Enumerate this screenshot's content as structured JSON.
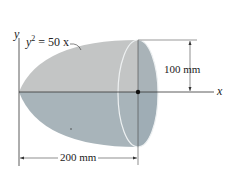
{
  "figure": {
    "equation": {
      "lhs": "y",
      "exponent": "2",
      "rhs": " = 50 x"
    },
    "axes": {
      "x_label": "x",
      "y_label": "y"
    },
    "dimensions": {
      "radius_label": "100 mm",
      "length_label": "200 mm"
    },
    "colors": {
      "upper_surface": "#c3c5c5",
      "lower_surface": "#a8b4ba",
      "end_face": "#9fadb5",
      "rim": "#e8ecee",
      "line": "#333333"
    }
  }
}
